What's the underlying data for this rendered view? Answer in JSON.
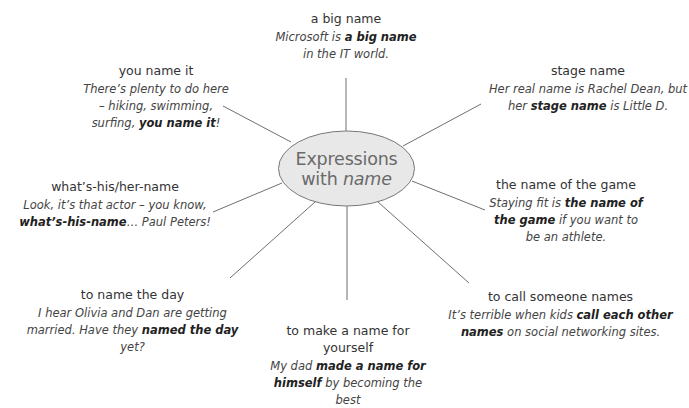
{
  "center": {
    "line1": "Expressions",
    "line2_prefix": "with ",
    "line2_italic": "name",
    "fill": "#e8e8e8",
    "stroke": "#777777",
    "text_color": "#6a6a6a"
  },
  "line_color": "#6f6f6f",
  "nodes": [
    {
      "id": "a-big-name",
      "title": "a big name",
      "example": [
        {
          "t": "Microsoft is ",
          "b": false
        },
        {
          "t": "a big name",
          "b": true
        },
        {
          "t": " in the IT world.",
          "b": false
        }
      ]
    },
    {
      "id": "you-name-it",
      "title": "you name it",
      "example": [
        {
          "t": "There’s plenty to do here – hiking, swimming, surfing, ",
          "b": false
        },
        {
          "t": "you name it",
          "b": true
        },
        {
          "t": "!",
          "b": false
        }
      ]
    },
    {
      "id": "stage-name",
      "title": "stage name",
      "example": [
        {
          "t": "Her real name is Rachel Dean, but her ",
          "b": false
        },
        {
          "t": "stage name",
          "b": true
        },
        {
          "t": " is Little D.",
          "b": false
        }
      ]
    },
    {
      "id": "whats-his-her-name",
      "title": "what’s-his/her-name",
      "example": [
        {
          "t": "Look, it’s that actor – you know, ",
          "b": false
        },
        {
          "t": "what’s-his-name",
          "b": true
        },
        {
          "t": "… Paul Peters!",
          "b": false
        }
      ]
    },
    {
      "id": "the-name-of-the-game",
      "title": "the name of the game",
      "example": [
        {
          "t": "Staying fit is ",
          "b": false
        },
        {
          "t": "the name of the game",
          "b": true
        },
        {
          "t": " if you want to be an athlete.",
          "b": false
        }
      ]
    },
    {
      "id": "to-name-the-day",
      "title": "to name the day",
      "example": [
        {
          "t": "I hear Olivia and Dan are getting married. Have they ",
          "b": false
        },
        {
          "t": "named the day",
          "b": true
        },
        {
          "t": " yet?",
          "b": false
        }
      ]
    },
    {
      "id": "to-make-a-name-for-yourself",
      "title": "to make a name for yourself",
      "example": [
        {
          "t": "My dad ",
          "b": false
        },
        {
          "t": "made a name for himself",
          "b": true
        },
        {
          "t": " by becoming the best",
          "b": false
        }
      ]
    },
    {
      "id": "to-call-someone-names",
      "title": "to call someone names",
      "example": [
        {
          "t": "It’s terrible when kids ",
          "b": false
        },
        {
          "t": "call each other names",
          "b": true
        },
        {
          "t": " on social networking sites.",
          "b": false
        }
      ]
    }
  ]
}
